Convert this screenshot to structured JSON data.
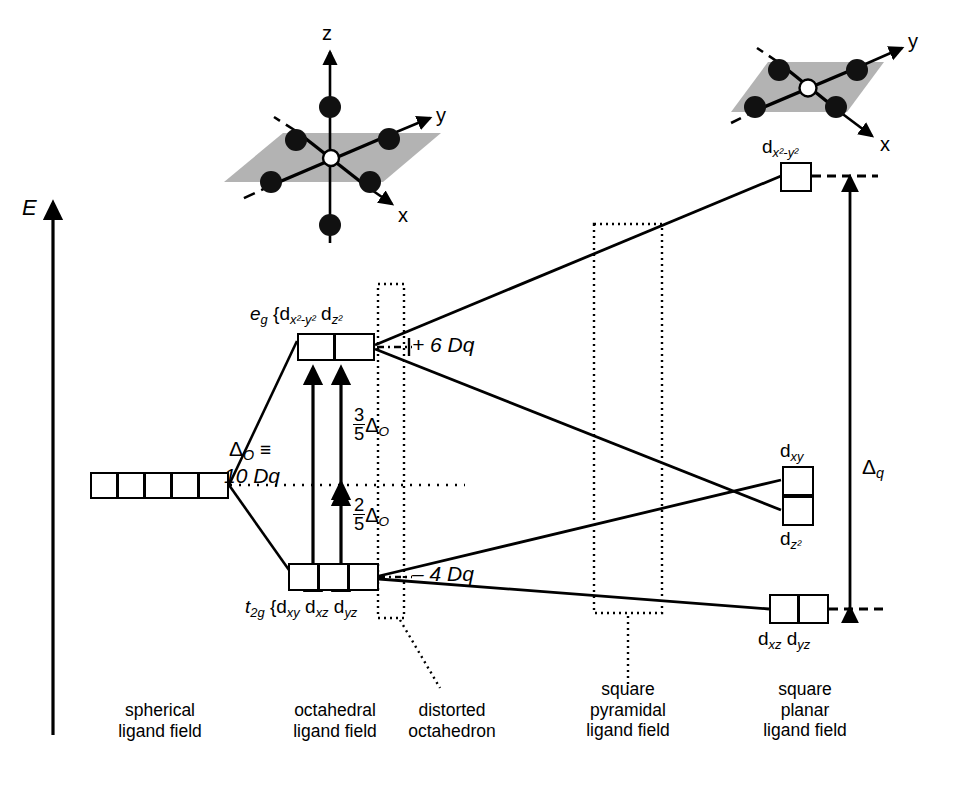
{
  "figure": {
    "domain": "crystal-field-splitting-diagram",
    "energy_axis_label": "E",
    "background_color": "#ffffff",
    "line_color": "#000000",
    "plane_fill_color": "#b3b3b3"
  },
  "structures": {
    "octahedral": {
      "name": "octahedral-complex",
      "axis_z": "z",
      "axis_y": "y",
      "axis_x": "x",
      "ligand_count": 6,
      "center_atom": "metal"
    },
    "square_planar": {
      "name": "square-planar-complex",
      "axis_y": "y",
      "axis_x": "x",
      "ligand_count": 4,
      "center_atom": "metal"
    }
  },
  "levels": {
    "spherical": {
      "label": "",
      "box_count": 5
    },
    "octahedral_eg": {
      "term": "e",
      "term_sub": "g",
      "brace": "{",
      "orbital_1": "d",
      "orbital_1_sub": "x²-y²",
      "orbital_2": "d",
      "orbital_2_sub": "z²",
      "box_count": 2,
      "energy_shift": "+ 6 Dq"
    },
    "octahedral_t2g": {
      "term": "t",
      "term_sub": "2g",
      "brace": "{",
      "orbital_1": "d",
      "orbital_1_sub": "xy",
      "orbital_2": "d",
      "orbital_2_sub": "xz",
      "orbital_3": "d",
      "orbital_3_sub": "yz",
      "box_count": 3,
      "energy_shift": "– 4 Dq"
    },
    "square_planar_dx2y2": {
      "orbital": "d",
      "orbital_sub": "x²-y²",
      "box_count": 1
    },
    "square_planar_dxy": {
      "orbital": "d",
      "orbital_sub": "xy",
      "box_count": 1
    },
    "square_planar_dz2": {
      "orbital": "d",
      "orbital_sub": "z²",
      "box_count": 1
    },
    "square_planar_dxz_dyz": {
      "orbital_1": "d",
      "orbital_1_sub": "xz",
      "orbital_2": "d",
      "orbital_2_sub": "yz",
      "box_count": 2
    }
  },
  "annotations": {
    "delta_o_line1_symbol": "Δ",
    "delta_o_line1_sub": "O",
    "delta_o_line1_equiv": "≡",
    "delta_o_line2": "10 Dq",
    "split_upper_num": "3",
    "split_upper_den": "5",
    "split_upper_symbol": "Δ",
    "split_upper_sub": "O",
    "split_lower_num": "2",
    "split_lower_den": "5",
    "split_lower_symbol": "Δ",
    "split_lower_sub": "O",
    "plus_six_dq": "+ 6 Dq",
    "minus_four_dq": "– 4 Dq",
    "delta_q_symbol": "Δ",
    "delta_q_sub": "q"
  },
  "captions": {
    "spherical": [
      "spherical",
      "ligand field"
    ],
    "octahedral": [
      "octahedral",
      "ligand field"
    ],
    "distorted": [
      "distorted",
      "octahedron"
    ],
    "square_pyramidal": [
      "square",
      "pyramidal",
      "ligand field"
    ],
    "square_planar": [
      "square",
      "planar",
      "ligand field"
    ]
  }
}
